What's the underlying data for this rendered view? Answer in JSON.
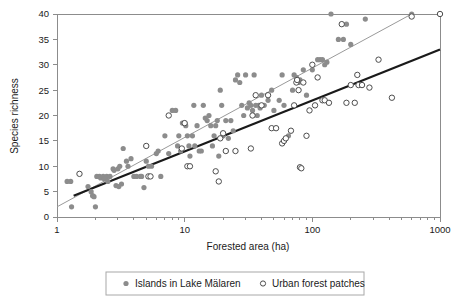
{
  "chart_data": {
    "type": "scatter",
    "title": "",
    "xlabel": "Forested area (ha)",
    "ylabel": "Species richness",
    "xscale": "log",
    "xlim": [
      1,
      1000
    ],
    "ylim": [
      0,
      40
    ],
    "xticks": [
      "1",
      "10",
      "100",
      "1000"
    ],
    "xtick_values": [
      1,
      10,
      100,
      1000
    ],
    "yticks": [
      "0",
      "5",
      "10",
      "15",
      "20",
      "25",
      "30",
      "35",
      "40"
    ],
    "ytick_values": [
      0,
      5,
      10,
      15,
      20,
      25,
      30,
      35,
      40
    ],
    "grid": false,
    "legend_position": "bottom",
    "colors": {
      "islands_marker": "#8c8c8c",
      "urban_marker": "#ffffff",
      "urban_marker_edge": "#4d4d4d",
      "islands_trendline": "#9a9a9a",
      "urban_trendline": "#1a1a1a",
      "axis": "#8c8c8c",
      "text": "#1a1a1a",
      "background": "#ffffff"
    },
    "series": [
      {
        "name": "Islands in Lake Mälaren",
        "marker": "filled-circle",
        "color": "#8c8c8c",
        "points": [
          [
            1.2,
            7
          ],
          [
            1.28,
            7
          ],
          [
            1.3,
            2
          ],
          [
            1.75,
            6
          ],
          [
            1.85,
            5
          ],
          [
            1.9,
            4.2
          ],
          [
            1.95,
            4
          ],
          [
            2.0,
            2
          ],
          [
            2.05,
            8
          ],
          [
            2.15,
            8
          ],
          [
            2.2,
            7.7
          ],
          [
            2.3,
            8
          ],
          [
            2.35,
            7.5
          ],
          [
            2.45,
            8
          ],
          [
            2.5,
            7
          ],
          [
            2.6,
            8
          ],
          [
            2.75,
            9.5
          ],
          [
            2.8,
            9.2
          ],
          [
            2.9,
            6.2
          ],
          [
            3.0,
            9.5
          ],
          [
            3.05,
            6
          ],
          [
            3.1,
            10
          ],
          [
            3.2,
            6.5
          ],
          [
            3.3,
            13.5
          ],
          [
            3.5,
            11
          ],
          [
            3.6,
            10
          ],
          [
            3.8,
            11.5
          ],
          [
            4.0,
            8
          ],
          [
            4.2,
            8
          ],
          [
            4.5,
            8
          ],
          [
            4.6,
            8
          ],
          [
            4.8,
            5.8
          ],
          [
            5.0,
            11
          ],
          [
            5.2,
            10
          ],
          [
            5.5,
            10
          ],
          [
            6.0,
            12.5
          ],
          [
            6.2,
            13
          ],
          [
            6.5,
            8
          ],
          [
            7.0,
            16
          ],
          [
            7.5,
            12.5
          ],
          [
            8.0,
            21
          ],
          [
            8.5,
            21
          ],
          [
            8.8,
            14
          ],
          [
            9.0,
            16
          ],
          [
            9.3,
            13
          ],
          [
            9.6,
            18.5
          ],
          [
            10.0,
            18.5
          ],
          [
            10.2,
            18
          ],
          [
            10.5,
            16
          ],
          [
            10.8,
            14
          ],
          [
            11.0,
            12
          ],
          [
            11.5,
            16
          ],
          [
            11.8,
            22
          ],
          [
            12.0,
            14
          ],
          [
            12.5,
            18
          ],
          [
            13.0,
            13
          ],
          [
            13.5,
            13
          ],
          [
            14.0,
            22
          ],
          [
            14.5,
            19.5
          ],
          [
            15.0,
            19
          ],
          [
            15.5,
            20
          ],
          [
            16.0,
            18
          ],
          [
            16.5,
            14
          ],
          [
            17.0,
            16
          ],
          [
            17.5,
            18
          ],
          [
            18.0,
            19
          ],
          [
            18.5,
            12
          ],
          [
            19.0,
            25
          ],
          [
            19.5,
            22
          ],
          [
            20.0,
            16
          ],
          [
            21.0,
            19
          ],
          [
            22.0,
            15.5
          ],
          [
            23.0,
            19
          ],
          [
            24.0,
            17
          ],
          [
            25.0,
            27
          ],
          [
            26.0,
            28
          ],
          [
            27.0,
            26.5
          ],
          [
            28.0,
            22
          ],
          [
            29.0,
            20
          ],
          [
            30.0,
            28
          ],
          [
            31.0,
            21.5
          ],
          [
            32.0,
            22.5
          ],
          [
            33.0,
            22
          ],
          [
            34.0,
            21
          ],
          [
            35.0,
            28
          ],
          [
            36.0,
            22
          ],
          [
            37.0,
            20
          ],
          [
            38.0,
            22
          ],
          [
            39.0,
            21.5
          ],
          [
            40.0,
            24
          ],
          [
            42.0,
            22
          ],
          [
            45.0,
            23
          ],
          [
            48.0,
            25
          ],
          [
            50.0,
            21
          ],
          [
            55.0,
            23
          ],
          [
            58.0,
            28
          ],
          [
            60.0,
            22
          ],
          [
            65.0,
            16
          ],
          [
            70.0,
            25
          ],
          [
            72.0,
            28
          ],
          [
            75.0,
            27.5
          ],
          [
            78.0,
            26.5
          ],
          [
            80.0,
            27
          ],
          [
            85.0,
            29
          ],
          [
            90.0,
            24
          ],
          [
            100.0,
            29
          ],
          [
            110.0,
            31
          ],
          [
            115.0,
            31
          ],
          [
            120.0,
            31
          ],
          [
            125.0,
            30
          ],
          [
            130.0,
            30.5
          ],
          [
            140.0,
            40
          ],
          [
            160.0,
            35
          ],
          [
            175.0,
            35
          ],
          [
            185.0,
            38
          ],
          [
            200.0,
            34
          ],
          [
            260.0,
            39
          ],
          [
            600.0,
            40
          ]
        ]
      },
      {
        "name": "Urban forest patches",
        "marker": "open-circle",
        "color": "#ffffff",
        "points": [
          [
            1.5,
            8.5
          ],
          [
            5.0,
            14
          ],
          [
            5.2,
            8
          ],
          [
            5.4,
            8
          ],
          [
            7.5,
            20
          ],
          [
            9.5,
            13.5
          ],
          [
            10.0,
            18.5
          ],
          [
            10.5,
            10
          ],
          [
            11.0,
            10
          ],
          [
            17.5,
            9
          ],
          [
            18.5,
            7
          ],
          [
            19.0,
            15.5
          ],
          [
            20.0,
            16.5
          ],
          [
            21.0,
            13
          ],
          [
            25.0,
            13
          ],
          [
            33.0,
            13.5
          ],
          [
            34.0,
            20
          ],
          [
            36.0,
            24
          ],
          [
            40.0,
            22
          ],
          [
            45.0,
            24
          ],
          [
            48.0,
            17.5
          ],
          [
            52.0,
            17.5
          ],
          [
            58.0,
            14.5
          ],
          [
            60.0,
            15
          ],
          [
            62.0,
            15.5
          ],
          [
            68.0,
            17
          ],
          [
            72.0,
            22
          ],
          [
            75.0,
            26.5
          ],
          [
            76.0,
            27
          ],
          [
            78.0,
            25
          ],
          [
            80.0,
            9.8
          ],
          [
            82.0,
            9.6
          ],
          [
            85.0,
            26.5
          ],
          [
            90.0,
            16
          ],
          [
            95.0,
            21
          ],
          [
            100.0,
            30
          ],
          [
            105.0,
            22
          ],
          [
            110.0,
            27.5
          ],
          [
            120.0,
            23
          ],
          [
            125.0,
            23
          ],
          [
            135.0,
            22.5
          ],
          [
            170.0,
            38
          ],
          [
            185.0,
            22.5
          ],
          [
            200.0,
            26
          ],
          [
            215.0,
            22.5
          ],
          [
            225.0,
            28
          ],
          [
            230.0,
            26
          ],
          [
            245.0,
            26
          ],
          [
            280.0,
            25.5
          ],
          [
            330.0,
            31
          ],
          [
            420.0,
            23.5
          ],
          [
            600.0,
            39.5
          ],
          [
            1000.0,
            40
          ]
        ]
      }
    ],
    "trendlines": [
      {
        "name": "Islands trendline",
        "style": "thin-gray",
        "color": "#9a9a9a",
        "width": 1,
        "x_start": 1.0,
        "y_start": 2.0,
        "x_end": 600.0,
        "y_end": 40.0
      },
      {
        "name": "Urban forest trendline",
        "style": "thick-black",
        "color": "#1a1a1a",
        "width": 2.2,
        "x_start": 1.35,
        "y_start": 4.2,
        "x_end": 1000.0,
        "y_end": 33.0
      }
    ],
    "legend": [
      {
        "label": "Islands in Lake Mälaren",
        "marker": "filled-circle"
      },
      {
        "label": "Urban forest patches",
        "marker": "open-circle"
      }
    ]
  }
}
